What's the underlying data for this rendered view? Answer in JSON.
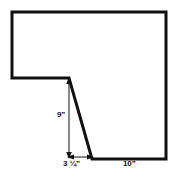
{
  "figure": {
    "type": "geometry-diagram",
    "background_color": "#ffffff",
    "outline_color": "#111111",
    "outline_width_px": 3,
    "dimension_line_color": "#111111",
    "dimension_line_width_px": 1,
    "outline_points": [
      {
        "x": 12,
        "y": 12,
        "name": "top-left-corner"
      },
      {
        "x": 166,
        "y": 12,
        "name": "top-right-corner"
      },
      {
        "x": 166,
        "y": 159,
        "name": "bottom-right-corner"
      },
      {
        "x": 92,
        "y": 159,
        "name": "bottom-slant-foot"
      },
      {
        "x": 69,
        "y": 78,
        "name": "notch-inner-corner"
      },
      {
        "x": 12,
        "y": 78,
        "name": "left-ledge-corner"
      }
    ],
    "dimensions": [
      {
        "id": "height",
        "label": "9”",
        "orientation": "vertical",
        "from": {
          "x": 69,
          "y": 79
        },
        "to": {
          "x": 69,
          "y": 157
        },
        "arrowheads": "both"
      },
      {
        "id": "base-short",
        "label": "3 ¼”",
        "orientation": "horizontal",
        "from": {
          "x": 69,
          "y": 157
        },
        "to": {
          "x": 92,
          "y": 157
        },
        "arrowheads": "both"
      },
      {
        "id": "base-long",
        "label": "10”",
        "orientation": "horizontal",
        "from": {
          "x": 92,
          "y": 159
        },
        "to": {
          "x": 166,
          "y": 159
        },
        "arrowheads": "none"
      }
    ]
  }
}
